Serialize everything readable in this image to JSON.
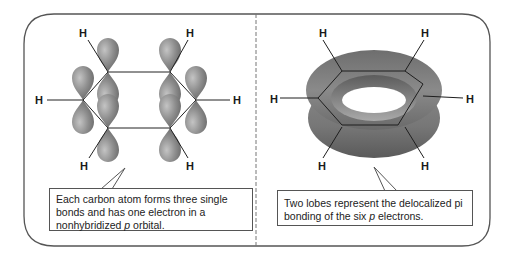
{
  "left_panel": {
    "subject": "benzene p orbitals",
    "atom_labels": [
      "H",
      "H",
      "H",
      "H",
      "H",
      "H"
    ],
    "callout": {
      "line1": "Each carbon atom forms three single",
      "line2": "bonds and has one electron in a",
      "line3_pre": "nonhybridized ",
      "line3_italic": "p",
      "line3_post": " orbital."
    }
  },
  "right_panel": {
    "subject": "delocalized pi electron cloud",
    "atom_labels": [
      "H",
      "H",
      "H",
      "H",
      "H",
      "H"
    ],
    "callout": {
      "line1": "Two lobes represent the delocalized pi",
      "line2_pre": "bonding of the six ",
      "line2_italic": "p",
      "line2_post": " electrons."
    }
  },
  "colors": {
    "frame": "#555555",
    "orbital": "#8e8e8e",
    "torus": "#7a7a7a",
    "bond": "#222222"
  }
}
